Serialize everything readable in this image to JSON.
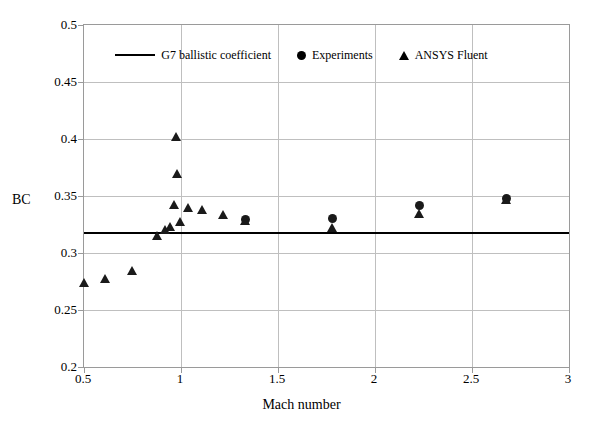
{
  "chart_data": {
    "type": "scatter",
    "title": "",
    "xlabel": "Mach number",
    "ylabel": "BC",
    "xlim": [
      0.5,
      3
    ],
    "ylim": [
      0.2,
      0.5
    ],
    "xticks": [
      "0.5",
      "1",
      "1.5",
      "2",
      "2.5",
      "3"
    ],
    "xtick_values": [
      0.5,
      1,
      1.5,
      2,
      2.5,
      3
    ],
    "yticks": [
      "0.2",
      "0.25",
      "0.3",
      "0.35",
      "0.4",
      "0.45",
      "0.5"
    ],
    "ytick_values": [
      0.2,
      0.25,
      0.3,
      0.35,
      0.4,
      0.45,
      0.5
    ],
    "grid": true,
    "legend_position": "top-center",
    "series": [
      {
        "name": "G7 ballistic coefficient",
        "marker": "line",
        "type": "hline",
        "color": "#000000",
        "value": 0.318
      },
      {
        "name": "Experiments",
        "marker": "circle",
        "type": "scatter",
        "color": "#1a1a1a",
        "points": [
          {
            "x": 1.33,
            "y": 0.3295
          },
          {
            "x": 1.78,
            "y": 0.3305
          },
          {
            "x": 2.23,
            "y": 0.3415
          },
          {
            "x": 2.68,
            "y": 0.3475
          }
        ]
      },
      {
        "name": "ANSYS Fluent",
        "marker": "triangle",
        "type": "scatter",
        "color": "#1a1a1a",
        "points": [
          {
            "x": 0.5,
            "y": 0.2735
          },
          {
            "x": 0.61,
            "y": 0.2775
          },
          {
            "x": 0.75,
            "y": 0.2845
          },
          {
            "x": 0.88,
            "y": 0.3145
          },
          {
            "x": 0.92,
            "y": 0.3205
          },
          {
            "x": 0.945,
            "y": 0.3225
          },
          {
            "x": 0.965,
            "y": 0.3425
          },
          {
            "x": 0.975,
            "y": 0.402
          },
          {
            "x": 0.98,
            "y": 0.369
          },
          {
            "x": 0.995,
            "y": 0.327
          },
          {
            "x": 1.04,
            "y": 0.3395
          },
          {
            "x": 1.11,
            "y": 0.3375
          },
          {
            "x": 1.22,
            "y": 0.333
          },
          {
            "x": 1.33,
            "y": 0.328
          },
          {
            "x": 1.78,
            "y": 0.3215
          },
          {
            "x": 2.23,
            "y": 0.334
          },
          {
            "x": 2.68,
            "y": 0.3465
          }
        ]
      }
    ]
  },
  "legend": {
    "items": [
      {
        "label": "G7 ballistic coefficient",
        "marker": "line"
      },
      {
        "label": "Experiments",
        "marker": "circle"
      },
      {
        "label": "ANSYS Fluent",
        "marker": "triangle"
      }
    ]
  },
  "axes": {
    "y_title": "BC",
    "x_title": "Mach number"
  },
  "colors": {
    "marker": "#1a1a1a",
    "line": "#000000",
    "grid": "#bfbfbf",
    "frame": "#9a9a9a",
    "background": "#ffffff"
  }
}
